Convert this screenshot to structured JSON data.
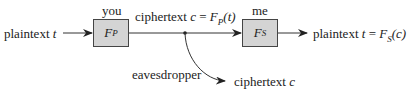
{
  "diagram": {
    "input_label": {
      "text": "plaintext",
      "var": "t"
    },
    "sender": {
      "role": "you",
      "func": "F",
      "sub": "P"
    },
    "channel_label": {
      "text": "ciphertext",
      "expr_var": "c",
      "eq": "=",
      "func": "F",
      "sub": "P",
      "arg": "(t)"
    },
    "receiver": {
      "role": "me",
      "func": "F",
      "sub": "S"
    },
    "output_label": {
      "text": "plaintext",
      "var": "t",
      "eq": "=",
      "func": "F",
      "sub": "S",
      "arg": "(c)"
    },
    "eavesdropper": {
      "label": "eavesdropper",
      "output_text": "ciphertext",
      "output_var": "c"
    },
    "colors": {
      "box_fill": "#d4d4d4",
      "stroke": "#333333"
    }
  }
}
